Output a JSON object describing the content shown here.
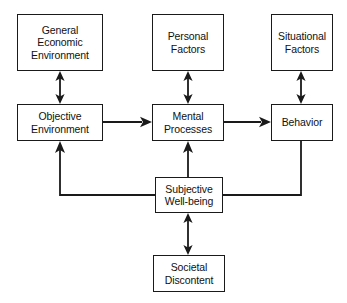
{
  "diagram": {
    "type": "flowchart",
    "background_color": "#ffffff",
    "line_color": "#1a1a1a",
    "text_color": "#111111",
    "nodes": [
      {
        "id": "general-economic-environment",
        "label": "General\nEconomic\nEnvironment",
        "x": 17,
        "y": 14,
        "w": 86,
        "h": 57
      },
      {
        "id": "personal-factors",
        "label": "Personal\nFactors",
        "x": 152,
        "y": 14,
        "w": 72,
        "h": 57
      },
      {
        "id": "situational-factors",
        "label": "Situational\nFactors",
        "x": 271,
        "y": 14,
        "w": 62,
        "h": 57
      },
      {
        "id": "objective-environment",
        "label": "Objective\nEnvironment",
        "x": 17,
        "y": 104,
        "w": 86,
        "h": 37
      },
      {
        "id": "mental-processes",
        "label": "Mental\nProcesses",
        "x": 152,
        "y": 104,
        "w": 72,
        "h": 37
      },
      {
        "id": "behavior",
        "label": "Behavior",
        "x": 271,
        "y": 104,
        "w": 62,
        "h": 37
      },
      {
        "id": "subjective-well-being",
        "label": "Subjective\nWell-being",
        "x": 155,
        "y": 177,
        "w": 68,
        "h": 36
      },
      {
        "id": "societal-discontent",
        "label": "Societal\nDiscontent",
        "x": 153,
        "y": 255,
        "w": 72,
        "h": 37
      }
    ],
    "edges": [
      {
        "id": "edge-gee-objenv",
        "from": "general-economic-environment",
        "to": "objective-environment",
        "style": "double-arrow-vertical"
      },
      {
        "id": "edge-personal-mental",
        "from": "personal-factors",
        "to": "mental-processes",
        "style": "double-arrow-vertical"
      },
      {
        "id": "edge-situational-behavior",
        "from": "situational-factors",
        "to": "behavior",
        "style": "double-arrow-vertical"
      },
      {
        "id": "edge-objenv-mental",
        "from": "objective-environment",
        "to": "mental-processes",
        "style": "arrow-right"
      },
      {
        "id": "edge-mental-behavior",
        "from": "mental-processes",
        "to": "behavior",
        "style": "arrow-right"
      },
      {
        "id": "edge-swb-mental",
        "from": "subjective-well-being",
        "to": "mental-processes",
        "style": "arrow-up"
      },
      {
        "id": "edge-swb-objenv",
        "from": "subjective-well-being",
        "to": "objective-environment",
        "style": "elbow-arrow-up-left"
      },
      {
        "id": "edge-behavior-swb",
        "from": "behavior",
        "to": "subjective-well-being",
        "style": "elbow-plain-down-left"
      },
      {
        "id": "edge-swb-societal",
        "from": "subjective-well-being",
        "to": "societal-discontent",
        "style": "double-arrow-vertical"
      }
    ]
  }
}
